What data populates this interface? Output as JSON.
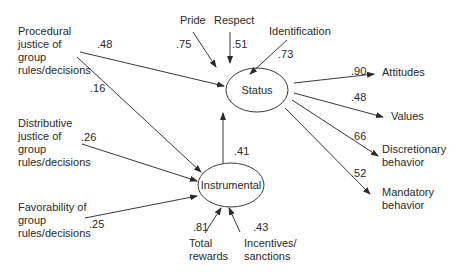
{
  "diagram": {
    "type": "path model",
    "latent_nodes": {
      "status": "Status",
      "instrumental": "Instrumental"
    },
    "predictors": {
      "procedural": "Procedural\njustice of\ngroup\nrules/decisions",
      "distributive": "Distributive\njustice of\ngroup\nrules/decisions",
      "favorability": "Favorability of\ngroup\nrules/decisions"
    },
    "status_indicators": {
      "pride": "Pride",
      "respect": "Respect",
      "identification": "Identification"
    },
    "instrumental_indicators": {
      "total_rewards": "Total\nrewards",
      "incentives": "Incentives/\nsanctions"
    },
    "outcomes": {
      "attitudes": "Attitudes",
      "values": "Values",
      "discretionary": "Discretionary\nbehavior",
      "mandatory": "Mandatory\nbehavior"
    },
    "coefficients": {
      "procedural_to_status": ".48",
      "procedural_to_instrumental": ".16",
      "distributive_to_instrumental": ".26",
      "favorability_to_instrumental": ".25",
      "pride": ".75",
      "respect": ".51",
      "identification": ".73",
      "instrumental_to_status": ".41",
      "total_rewards": ".81",
      "incentives": ".43",
      "attitudes": ".90",
      "values": ".48",
      "discretionary": ".66",
      "mandatory": ".52"
    }
  }
}
